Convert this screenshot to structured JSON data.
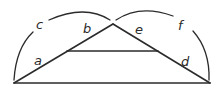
{
  "diagram": {
    "type": "geometry-triangle-with-arcs",
    "points": {
      "left_vertex": [
        14,
        83
      ],
      "apex": [
        113,
        24
      ],
      "right_vertex": [
        210,
        83
      ],
      "inner_left": [
        67,
        51
      ],
      "inner_right": [
        158,
        51
      ]
    },
    "labels": {
      "a": "a",
      "b": "b",
      "c": "c",
      "d": "d",
      "e": "e",
      "f": "f"
    },
    "stroke_color": "#2b2b2b"
  }
}
